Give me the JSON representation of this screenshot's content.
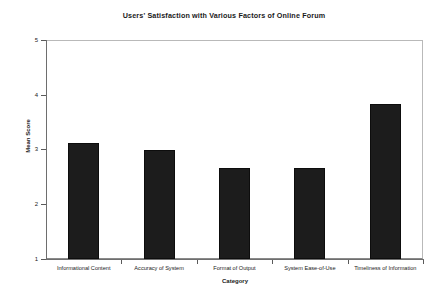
{
  "chart_data": {
    "type": "bar",
    "title": "Users' Satisfaction with Various Factors of Online Forum",
    "xlabel": "Category",
    "ylabel": "Mean Score",
    "categories": [
      "Informational Content",
      "Accuracy of System",
      "Format of Output",
      "System Ease-of-Use",
      "Timeliness of Information"
    ],
    "values": [
      3.11,
      3.0,
      2.66,
      2.66,
      3.84
    ],
    "ylim": [
      1,
      5
    ],
    "yticks": [
      1,
      2,
      3,
      4,
      5
    ],
    "ytick_labels": [
      "1",
      "2",
      "3",
      "4",
      "5"
    ],
    "grid": false,
    "legend": null,
    "bar_color": "#1c1c1c",
    "background_color": "#ffffff"
  }
}
